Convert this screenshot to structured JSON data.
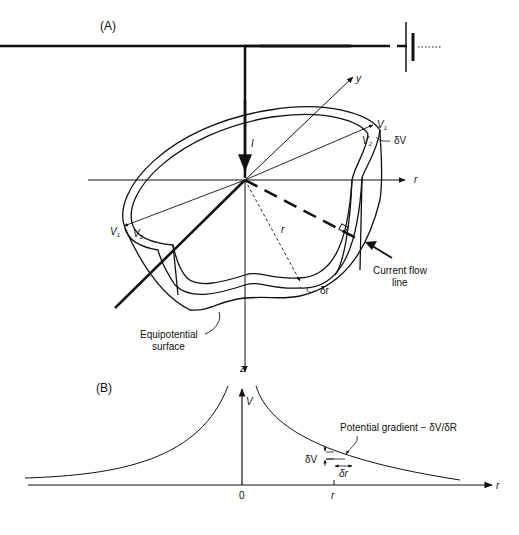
{
  "figure": {
    "panel_a": {
      "label": "(A)",
      "axes": {
        "y": "y",
        "r": "r",
        "z": "z"
      },
      "current_label": "I",
      "v1_right": "V",
      "v1_right_sub": "1",
      "v2_right": "V",
      "v2_right_sub": "2",
      "v1_left": "V",
      "v1_left_sub": "1",
      "v2_left": "V",
      "v2_left_sub": "2",
      "delta_v": "δV",
      "radius": "r",
      "delta_r": "δr",
      "current_flow_line": [
        "Current flow",
        "line"
      ],
      "equipotential_surface": [
        "Equipotential",
        "surface"
      ]
    },
    "panel_b": {
      "label": "(B)",
      "y_axis": "V",
      "x_axis": "r",
      "origin": "0",
      "r_tick": "r",
      "gradient_label": "Potential gradient   − δV/δR",
      "delta_v": "δV",
      "delta_r": "δr"
    },
    "colors": {
      "ink": "#111111",
      "background": "#ffffff"
    }
  }
}
